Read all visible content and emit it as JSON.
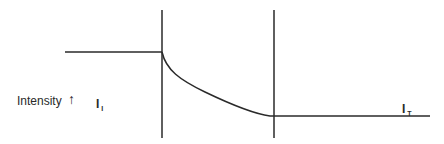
{
  "diagram": {
    "y_label": "Intensity",
    "y_arrow_icon": "up-arrow",
    "labels": {
      "incident": {
        "main": "I",
        "sub": "I"
      },
      "transmitted": {
        "main": "I",
        "sub": "T"
      }
    },
    "colors": {
      "line": "#2a2a2a",
      "background": "#ffffff"
    },
    "regions": [
      "before-medium",
      "absorbing-medium",
      "after-medium"
    ]
  }
}
